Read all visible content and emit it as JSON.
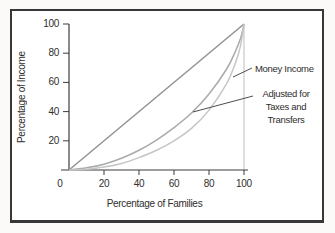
{
  "figure": {
    "annotations": {
      "money_income": "Money Income",
      "adjusted": "Adjusted for\nTaxes and\nTransfers"
    }
  },
  "chart_data": {
    "type": "line",
    "title": "",
    "xlabel": "Percentage of Families",
    "ylabel": "Percentage of Income",
    "xlim": [
      0,
      100
    ],
    "ylim": [
      0,
      100
    ],
    "x_ticks": [
      0,
      20,
      40,
      60,
      80,
      100
    ],
    "y_ticks": [
      20,
      40,
      60,
      80,
      100
    ],
    "grid": false,
    "legend_position": "annotated-right-of-plot",
    "colors": {
      "frame": "#373737",
      "axis": "#3c3c3c",
      "right_border": "#bdbdbd",
      "equality_line": "#909296",
      "adjusted_curve": "#a8aaac",
      "money_curve": "#c4c6c8",
      "leader_line": "#4d4d4d",
      "text": "#2f2e2c"
    },
    "series": [
      {
        "name": "line-of-equality",
        "label": "",
        "color": "#909296",
        "points": [
          [
            0,
            0
          ],
          [
            100,
            100
          ]
        ]
      },
      {
        "name": "adjusted-for-taxes-and-transfers",
        "label": "Adjusted for Taxes and Transfers",
        "color": "#a8aaac",
        "points": [
          [
            0,
            0
          ],
          [
            10,
            1.5
          ],
          [
            20,
            4
          ],
          [
            30,
            8
          ],
          [
            40,
            13.5
          ],
          [
            50,
            20.5
          ],
          [
            60,
            29
          ],
          [
            70,
            39
          ],
          [
            80,
            52
          ],
          [
            90,
            69
          ],
          [
            95,
            81
          ],
          [
            98,
            90
          ],
          [
            100,
            100
          ]
        ]
      },
      {
        "name": "money-income",
        "label": "Money Income",
        "color": "#c4c6c8",
        "points": [
          [
            0,
            0
          ],
          [
            10,
            0.5
          ],
          [
            20,
            2
          ],
          [
            30,
            4.5
          ],
          [
            40,
            8.5
          ],
          [
            50,
            13.5
          ],
          [
            60,
            20
          ],
          [
            70,
            28.5
          ],
          [
            80,
            41
          ],
          [
            90,
            59
          ],
          [
            95,
            73
          ],
          [
            98,
            85
          ],
          [
            100,
            100
          ]
        ]
      }
    ],
    "annotations": [
      {
        "text": "Money Income",
        "series": "money-income",
        "target_xy": [
          94,
          64
        ]
      },
      {
        "text": "Adjusted for Taxes and Transfers",
        "series": "adjusted-for-taxes-and-transfers",
        "target_xy": [
          71,
          40
        ]
      }
    ]
  }
}
